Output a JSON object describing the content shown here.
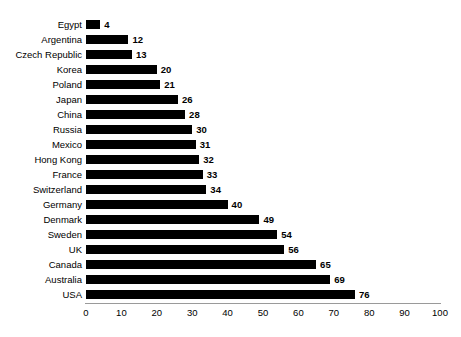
{
  "chart_data": {
    "type": "bar",
    "orientation": "horizontal",
    "title": "",
    "subtitle": "",
    "xlabel": "",
    "ylabel": "",
    "xlim": [
      0,
      100
    ],
    "ylim": null,
    "grid": false,
    "legend": null,
    "legend_position": "none",
    "xticks": [
      0,
      10,
      20,
      30,
      40,
      50,
      60,
      70,
      80,
      90,
      100
    ],
    "xtick_labels": [
      "0",
      "10",
      "20",
      "30",
      "40",
      "50",
      "60",
      "70",
      "80",
      "90",
      "100"
    ],
    "bar_color": "#000000",
    "axis_color": "#9a9a9a",
    "text_color": "#000000",
    "show_value_labels": true,
    "categories": [
      "Egypt",
      "Argentina",
      "Czech Republic",
      "Korea",
      "Poland",
      "Japan",
      "China",
      "Russia",
      "Mexico",
      "Hong Kong",
      "France",
      "Switzerland",
      "Germany",
      "Denmark",
      "Sweden",
      "UK",
      "Canada",
      "Australia",
      "USA"
    ],
    "values": [
      4,
      12,
      13,
      20,
      21,
      26,
      28,
      30,
      31,
      32,
      33,
      34,
      40,
      49,
      54,
      56,
      65,
      69,
      76
    ],
    "value_labels": [
      "4",
      "12",
      "13",
      "20",
      "21",
      "26",
      "28",
      "30",
      "31",
      "32",
      "33",
      "34",
      "40",
      "49",
      "54",
      "56",
      "65",
      "69",
      "76"
    ]
  }
}
